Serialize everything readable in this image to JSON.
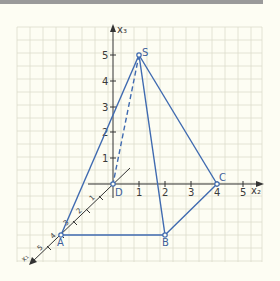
{
  "diagram": {
    "type": "3d-coordinate-pyramid",
    "axes": {
      "x1": {
        "label": "x₁",
        "ticks": [
          "1",
          "2",
          "3",
          "4",
          "5"
        ]
      },
      "x2": {
        "label": "x₂",
        "ticks": [
          "1",
          "2",
          "3",
          "4",
          "5"
        ]
      },
      "x3": {
        "label": "x₃",
        "ticks": [
          "1",
          "2",
          "3",
          "4",
          "5"
        ]
      }
    },
    "points": {
      "A": {
        "label": "A"
      },
      "B": {
        "label": "B"
      },
      "C": {
        "label": "C"
      },
      "D": {
        "label": "D"
      },
      "S": {
        "label": "S"
      }
    },
    "edges": [
      {
        "from": "A",
        "to": "B",
        "style": "solid"
      },
      {
        "from": "B",
        "to": "C",
        "style": "solid"
      },
      {
        "from": "C",
        "to": "D",
        "style": "solid"
      },
      {
        "from": "D",
        "to": "A",
        "style": "solid"
      },
      {
        "from": "S",
        "to": "A",
        "style": "solid"
      },
      {
        "from": "S",
        "to": "B",
        "style": "solid"
      },
      {
        "from": "S",
        "to": "C",
        "style": "solid"
      },
      {
        "from": "S",
        "to": "D",
        "style": "dashed"
      }
    ],
    "colors": {
      "edge": "#3f6ab0",
      "axis": "#333333",
      "grid": "#dcdccc",
      "background": "#fdfdf3"
    }
  }
}
